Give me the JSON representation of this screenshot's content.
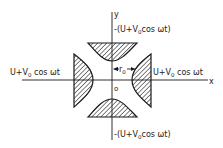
{
  "diagram": {
    "type": "quadrupole-electrode-cross-section",
    "axes": {
      "x_label": "x",
      "y_label": "y",
      "origin_label": "o"
    },
    "radius_label": {
      "base": "r",
      "subscript": "0"
    },
    "electrodes": {
      "left": {
        "potential_prefix": "U+V",
        "subscript": "0",
        "potential_suffix": " cos ωt"
      },
      "right": {
        "potential_prefix": "U+V",
        "subscript": "0",
        "potential_suffix": " cos ωt"
      },
      "top": {
        "potential_prefix": "-(U+V",
        "subscript": "0",
        "potential_suffix": "cos ωt)"
      },
      "bottom": {
        "potential_prefix": "-(U+V",
        "subscript": "0",
        "potential_suffix": "cos ωt)"
      }
    },
    "colors": {
      "ink": "#1a1a1a",
      "background": "#ffffff"
    }
  }
}
